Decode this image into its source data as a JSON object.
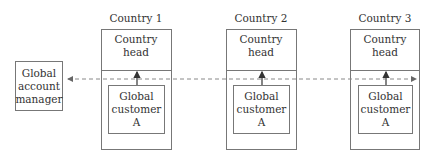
{
  "manager": {
    "lines": [
      "Global",
      "account",
      "manager"
    ]
  },
  "countries": [
    {
      "name": "Country 1",
      "head_lines": [
        "Country",
        "head"
      ],
      "customer_lines": [
        "Global",
        "customer",
        "A"
      ]
    },
    {
      "name": "Country 2",
      "head_lines": [
        "Country",
        "head"
      ],
      "customer_lines": [
        "Global",
        "customer",
        "A"
      ]
    },
    {
      "name": "Country 3",
      "head_lines": [
        "Country",
        "head"
      ],
      "customer_lines": [
        "Global",
        "customer",
        "A"
      ]
    }
  ],
  "connector": {
    "style": "dashed",
    "direction": "bidirectional",
    "from": "Global account manager",
    "to": "Country 3"
  },
  "colors": {
    "line": "#777777",
    "text": "#333333",
    "arrow": "#333333"
  }
}
